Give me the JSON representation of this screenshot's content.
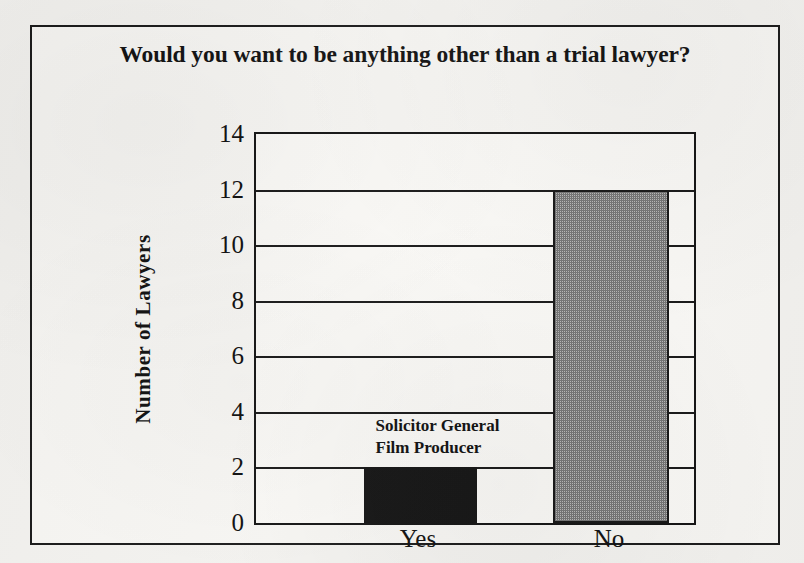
{
  "chart_data": {
    "type": "bar",
    "title": "Would you want to be anything other than a  trial lawyer?",
    "xlabel": "",
    "ylabel": "Number of Lawyers",
    "categories": [
      "Yes",
      "No"
    ],
    "values": [
      2,
      12
    ],
    "ylim": [
      0,
      14
    ],
    "yticks": [
      0,
      2,
      4,
      6,
      8,
      10,
      12,
      14
    ],
    "ytick_labels": [
      "0",
      "2",
      "4",
      "6",
      "8",
      "10",
      "12",
      "14"
    ],
    "grid": true,
    "legend": null,
    "series": [
      {
        "name": "Number of Lawyers",
        "values": [
          2,
          12
        ],
        "styles": [
          "solid-black",
          "gray-hatched"
        ]
      }
    ],
    "annotations": [
      {
        "target_category": "Yes",
        "lines": [
          "Solicitor General",
          "Film Producer"
        ]
      }
    ],
    "colors": {
      "bar_yes": "#141414",
      "bar_no": "#808080",
      "axis": "#141414",
      "text": "#111111",
      "plot_background": "#faf9f6",
      "page_background": "#f3f2ef"
    }
  },
  "annotation_lines": {
    "line1": "Solicitor General",
    "line2": "Film Producer"
  }
}
